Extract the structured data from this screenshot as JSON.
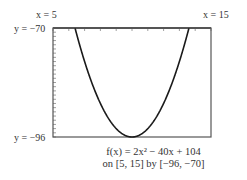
{
  "chart_data": {
    "type": "line",
    "title": "f(x) = 2x² − 40x + 104",
    "subtitle": "on [5, 15] by [−96, −70]",
    "function": "2x^2 - 40x + 104",
    "xlim": [
      5,
      15
    ],
    "ylim": [
      -96,
      -70
    ],
    "xlabel": "",
    "ylabel": "",
    "grid": false,
    "x_ticks": [
      5,
      6,
      7,
      8,
      9,
      10,
      11,
      12,
      13,
      14,
      15
    ],
    "y_ticks": [
      -96,
      -95,
      -94,
      -93,
      -92,
      -91,
      -90,
      -89,
      -88,
      -87,
      -86,
      -85,
      -84,
      -83,
      -82,
      -81,
      -80,
      -79,
      -78,
      -77,
      -76,
      -75,
      -74,
      -73,
      -72,
      -71,
      -70
    ],
    "series": [
      {
        "name": "f(x)",
        "x": [
          6.39,
          7,
          7.5,
          8,
          8.5,
          9,
          9.5,
          10,
          10.5,
          11,
          11.5,
          12,
          12.5,
          13,
          13.61
        ],
        "y": [
          -70,
          -78,
          -83.5,
          -88,
          -91.5,
          -94,
          -95.5,
          -96,
          -95.5,
          -94,
          -91.5,
          -88,
          -83.5,
          -78,
          -70
        ]
      }
    ],
    "window_labels": {
      "x_min": "x = 5",
      "x_max": "x = 15",
      "y_max": "y = −70",
      "y_min": "y = −96"
    }
  },
  "labels": {
    "x_min": "x = 5",
    "x_max": "x = 15",
    "y_max": "y = −70",
    "y_min": "y = −96",
    "caption_line1": "f(x) = 2x² − 40x + 104",
    "caption_line2": "on [5, 15] by [−96, −70]"
  },
  "colors": {
    "curve": "#1a1a1a",
    "frame": "#555555",
    "tick": "#888888"
  }
}
